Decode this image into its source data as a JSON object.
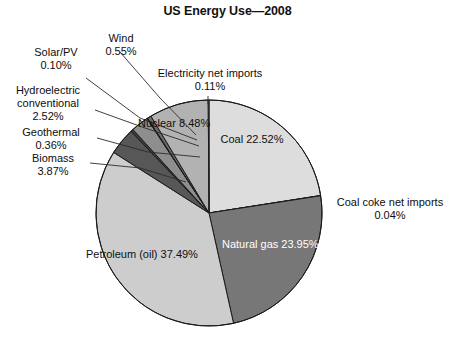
{
  "chart_data": {
    "type": "pie",
    "title": "US Energy Use—2008",
    "xlabel": "",
    "ylabel": "",
    "legend": "none",
    "grid": false,
    "units": "percent",
    "total": 99.99,
    "categories": [
      "Coal",
      "Coal coke net imports",
      "Natural gas",
      "Petroleum (oil)",
      "Biomass",
      "Geothermal",
      "Hydroelectric conventional",
      "Solar/PV",
      "Wind",
      "Nuclear",
      "Electricity net imports"
    ],
    "values": [
      22.52,
      0.04,
      23.95,
      37.49,
      3.87,
      0.36,
      2.52,
      0.1,
      0.55,
      8.48,
      0.11
    ],
    "slices": [
      {
        "label": "Coal",
        "value": 22.52,
        "value_text": "22.52%",
        "color": "#dddddd",
        "placement": "inside",
        "text_color": "#101010"
      },
      {
        "label": "Coal coke net imports",
        "value": 0.04,
        "value_text": "0.04%",
        "color": "#9a9a9a",
        "placement": "callout",
        "text_color": "#0d0d0d"
      },
      {
        "label": "Natural gas",
        "value": 23.95,
        "value_text": "23.95%",
        "color": "#777777",
        "placement": "inside",
        "text_color": "#ffffff"
      },
      {
        "label": "Petroleum (oil)",
        "value": 37.49,
        "value_text": "37.49%",
        "color": "#cdcdcd",
        "placement": "inside",
        "text_color": "#101010"
      },
      {
        "label": "Biomass",
        "value": 3.87,
        "value_text": "3.87%",
        "color": "#575757",
        "placement": "callout",
        "text_color": "#0d0d0d"
      },
      {
        "label": "Geothermal",
        "value": 0.36,
        "value_text": "0.36%",
        "color": "#3f3f3f",
        "placement": "callout",
        "text_color": "#0d0d0d"
      },
      {
        "label": "Hydroelectric conventional",
        "value": 2.52,
        "value_text": "2.52%",
        "color": "#8e8e8e",
        "placement": "callout",
        "text_color": "#0d0d0d"
      },
      {
        "label": "Solar/PV",
        "value": 0.1,
        "value_text": "0.10%",
        "color": "#4a4a4a",
        "placement": "callout",
        "text_color": "#0d0d0d"
      },
      {
        "label": "Wind",
        "value": 0.55,
        "value_text": "0.55%",
        "color": "#6d6d6d",
        "placement": "callout",
        "text_color": "#0d0d0d"
      },
      {
        "label": "Nuclear",
        "value": 8.48,
        "value_text": "8.48%",
        "color": "#b2b2b2",
        "placement": "inside",
        "text_color": "#101010"
      },
      {
        "label": "Electricity net imports",
        "value": 0.11,
        "value_text": "0.11%",
        "color": "#e8e8e8",
        "placement": "callout",
        "text_color": "#0d0d0d"
      }
    ],
    "geometry": {
      "cx": 209,
      "cy": 213,
      "r": 113,
      "start_angle_deg": 0,
      "direction": "clockwise"
    },
    "style": {
      "stroke": "#1a1a1a",
      "stroke_width": 1,
      "background": "#ffffff",
      "leader_line_color": "#2b2b2b"
    }
  },
  "labels": {
    "wind": {
      "name": "Wind",
      "pct": "0.55%"
    },
    "solar": {
      "name": "Solar/PV",
      "pct": "0.10%"
    },
    "hydro_line1": "Hydroelectric",
    "hydro_line2": "conventional",
    "hydro_pct": "2.52%",
    "geothermal": {
      "name": "Geothermal",
      "pct": "0.36%"
    },
    "biomass": {
      "name": "Biomass",
      "pct": "3.87%"
    },
    "electricity": {
      "name": "Electricity net imports",
      "pct": "0.11%"
    },
    "coalcoke": {
      "name": "Coal coke net imports",
      "pct": "0.04%"
    },
    "nuclear": {
      "name": "Nuclear",
      "pct": "8.48%"
    },
    "coal": {
      "name": "Coal",
      "pct": "22.52%"
    },
    "natgas": {
      "name": "Natural gas",
      "pct": "23.95%"
    },
    "petroleum": {
      "name": "Petroleum (oil)",
      "pct": "37.49%"
    }
  }
}
